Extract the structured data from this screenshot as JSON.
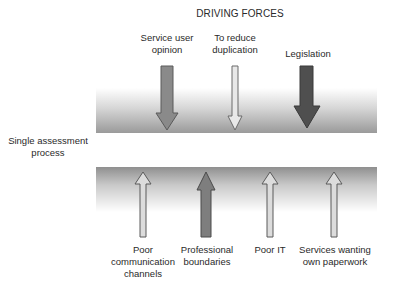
{
  "title": "DRIVING FORCES",
  "center_label": "Single assessment process",
  "center_label_lines": [
    "Single assessment",
    "process"
  ],
  "driving_forces": [
    {
      "label_lines": [
        "Service user",
        "opinion"
      ],
      "label": "Service user opinion",
      "color": "#8a8a8a",
      "strength": "medium"
    },
    {
      "label_lines": [
        "To reduce",
        "duplication"
      ],
      "label": "To reduce duplication",
      "color": "#e4e4e4",
      "strength": "weak"
    },
    {
      "label_lines": [
        "Legislation"
      ],
      "label": "Legislation",
      "color": "#4f4f4f",
      "strength": "strong"
    }
  ],
  "restraining_forces": [
    {
      "label_lines": [
        "Poor",
        "communication",
        "channels"
      ],
      "label": "Poor communication channels",
      "color": "#dcdcdc"
    },
    {
      "label_lines": [
        "Professional",
        "boundaries"
      ],
      "label": "Professional boundaries",
      "color": "#7e7e7e"
    },
    {
      "label_lines": [
        "Poor IT"
      ],
      "label": "Poor IT",
      "color": "#dcdcdc"
    },
    {
      "label_lines": [
        "Services wanting",
        "own paperwork"
      ],
      "label": "Services wanting own paperwork",
      "color": "#dcdcdc"
    }
  ]
}
